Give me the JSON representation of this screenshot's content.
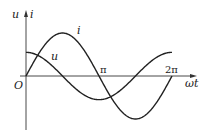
{
  "diagram": {
    "title": "",
    "axis": {
      "y_label": "u",
      "y_label2": "i",
      "x_label": "ωt",
      "origin_label": "O",
      "tick_labels": [
        "π",
        "2π"
      ]
    },
    "curves": [
      {
        "name": "i",
        "label": "i",
        "function": "sin(ωt)",
        "relative_amplitude": 1.0
      },
      {
        "name": "u",
        "label": "u",
        "function": "cos(ωt)",
        "relative_amplitude": 0.55
      }
    ],
    "colors": {
      "line": "#222222",
      "background": "#ffffff"
    }
  }
}
